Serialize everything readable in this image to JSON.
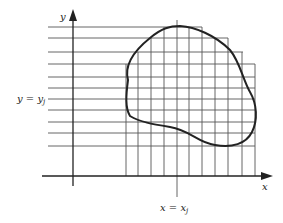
{
  "diagram": {
    "axes": {
      "x_label": "x",
      "y_label": "y"
    },
    "annotations": {
      "horizontal_line_label": "y = y",
      "horizontal_line_subscript": "j",
      "vertical_line_label": "x = x",
      "vertical_line_subscript": "j"
    },
    "elements": [
      "x-axis with arrow",
      "y-axis with arrow",
      "horizontal grid lines",
      "vertical grid lines",
      "closed curve region boundary"
    ],
    "colors": {
      "ink": "#222222",
      "background": "#ffffff"
    }
  }
}
